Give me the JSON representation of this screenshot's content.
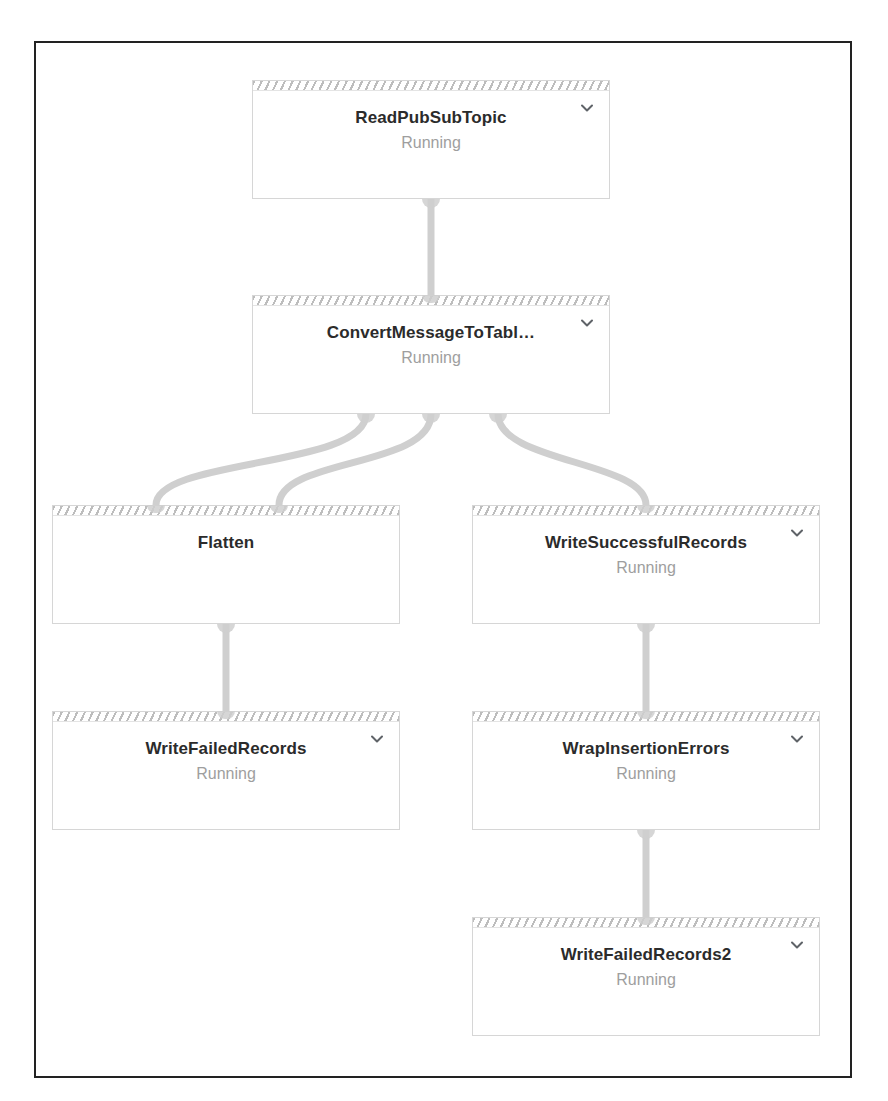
{
  "graph": {
    "title": "Dataflow job graph",
    "status_label": "Running",
    "chevron_icon": "chevron-down-icon",
    "colors": {
      "frame_border": "#222222",
      "node_border": "#d6d6d6",
      "node_background": "#ffffff",
      "header_hatch": "#bdbdbd",
      "title_text": "#2b2b2b",
      "status_text": "#9e9e9e",
      "edge": "#cfcfcf"
    },
    "nodes": [
      {
        "id": "read-pub-sub-topic",
        "title": "ReadPubSubTopic",
        "status": "Running",
        "has_chevron": true,
        "x": 216,
        "y": 37,
        "w": 358,
        "h": 119
      },
      {
        "id": "convert-message-to-table",
        "title": "ConvertMessageToTabl…",
        "status": "Running",
        "has_chevron": true,
        "x": 216,
        "y": 252,
        "w": 358,
        "h": 119
      },
      {
        "id": "flatten",
        "title": "Flatten",
        "status": "",
        "has_chevron": false,
        "x": 16,
        "y": 462,
        "w": 348,
        "h": 119
      },
      {
        "id": "write-successful-records",
        "title": "WriteSuccessfulRecords",
        "status": "Running",
        "has_chevron": true,
        "x": 436,
        "y": 462,
        "w": 348,
        "h": 119
      },
      {
        "id": "write-failed-records",
        "title": "WriteFailedRecords",
        "status": "Running",
        "has_chevron": true,
        "x": 16,
        "y": 668,
        "w": 348,
        "h": 119
      },
      {
        "id": "wrap-insertion-errors",
        "title": "WrapInsertionErrors",
        "status": "Running",
        "has_chevron": true,
        "x": 436,
        "y": 668,
        "w": 348,
        "h": 119
      },
      {
        "id": "write-failed-records-2",
        "title": "WriteFailedRecords2",
        "status": "Running",
        "has_chevron": true,
        "x": 436,
        "y": 874,
        "w": 348,
        "h": 119
      }
    ],
    "edges": [
      {
        "id": "edge-read-to-convert",
        "from": "read-pub-sub-topic",
        "to": "convert-message-to-table"
      },
      {
        "id": "edge-convert-to-flatten-a",
        "from": "convert-message-to-table",
        "to": "flatten"
      },
      {
        "id": "edge-convert-to-flatten-b",
        "from": "convert-message-to-table",
        "to": "flatten"
      },
      {
        "id": "edge-convert-to-write-successful",
        "from": "convert-message-to-table",
        "to": "write-successful-records"
      },
      {
        "id": "edge-flatten-to-write-failed",
        "from": "flatten",
        "to": "write-failed-records"
      },
      {
        "id": "edge-write-successful-to-wrap",
        "from": "write-successful-records",
        "to": "wrap-insertion-errors"
      },
      {
        "id": "edge-wrap-to-write-failed-2",
        "from": "wrap-insertion-errors",
        "to": "write-failed-records-2"
      }
    ]
  }
}
